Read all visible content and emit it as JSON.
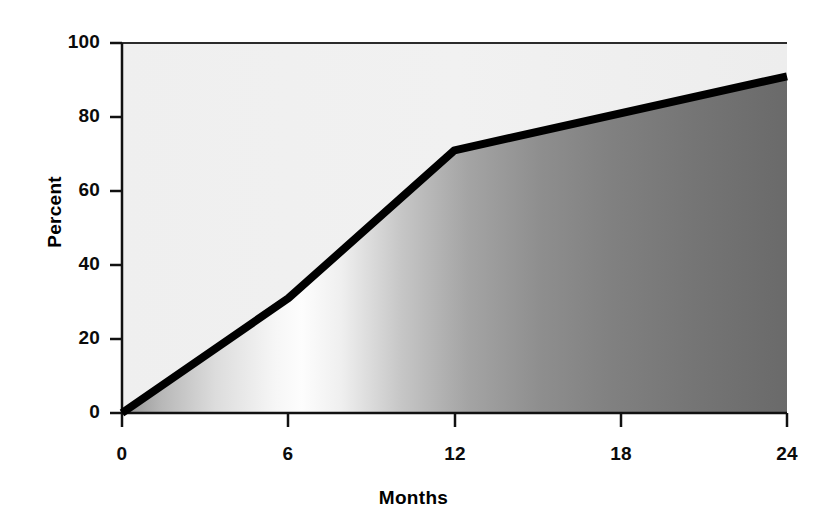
{
  "chart_data": {
    "type": "area",
    "title": "",
    "subtitle": "",
    "xlabel": "Months",
    "ylabel": "Percent",
    "x": [
      0,
      6,
      12,
      24
    ],
    "values": [
      0,
      31,
      71,
      91
    ],
    "series": [
      {
        "name": "Percent",
        "x": [
          0,
          6,
          12,
          24
        ],
        "values": [
          0,
          31,
          71,
          91
        ]
      }
    ],
    "xtick_labels": [
      "0",
      "6",
      "12",
      "18",
      "24"
    ],
    "xticks": [
      0,
      6,
      12,
      18,
      24
    ],
    "ytick_labels": [
      "0",
      "20",
      "40",
      "60",
      "80",
      "100"
    ],
    "yticks": [
      0,
      20,
      40,
      60,
      80,
      100
    ],
    "xlim": [
      0,
      24
    ],
    "ylim": [
      0,
      100
    ],
    "grid": false,
    "legend": null,
    "annotations": [],
    "colors": {
      "line": "#000000",
      "plot_background": "#f0f0f0",
      "fill_gradient_start": "#9a9a9a",
      "fill_gradient_mid": "#fbfbfb",
      "fill_gradient_end": "#6d6d6d",
      "axis": "#111111",
      "text": "#000000"
    }
  },
  "axes": {
    "y": {
      "label": "Percent",
      "ticks": [
        {
          "label": "100"
        },
        {
          "label": "80"
        },
        {
          "label": "60"
        },
        {
          "label": "40"
        },
        {
          "label": "20"
        },
        {
          "label": "0"
        }
      ]
    },
    "x": {
      "label": "Months",
      "ticks": [
        {
          "label": "0"
        },
        {
          "label": "6"
        },
        {
          "label": "12"
        },
        {
          "label": "18"
        },
        {
          "label": "24"
        }
      ]
    }
  }
}
